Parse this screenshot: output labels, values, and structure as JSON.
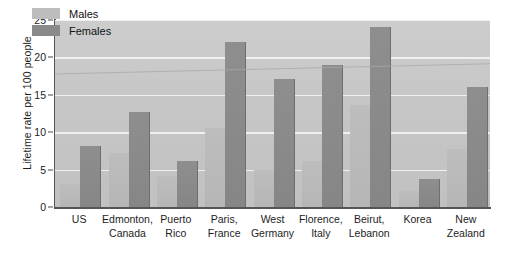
{
  "chart_data": {
    "type": "bar",
    "title": "",
    "xlabel": "",
    "ylabel": "Lifetime rate per 100 people",
    "ylim": [
      0,
      25
    ],
    "yticks": [
      0,
      5,
      10,
      15,
      20,
      25
    ],
    "grid": true,
    "legend_position": "top-left",
    "categories": [
      "US",
      "Edmonton, Canada",
      "Puerto Rico",
      "Paris, France",
      "West Germany",
      "Florence, Italy",
      "Beirut, Lebanon",
      "Korea",
      "New Zealand"
    ],
    "category_lines": [
      [
        "US"
      ],
      [
        "Edmonton,",
        "Canada"
      ],
      [
        "Puerto",
        "Rico"
      ],
      [
        "Paris,",
        "France"
      ],
      [
        "West",
        "Germany"
      ],
      [
        "Florence,",
        "Italy"
      ],
      [
        "Beirut,",
        "Lebanon"
      ],
      [
        "Korea"
      ],
      [
        "New",
        "Zealand"
      ]
    ],
    "series": [
      {
        "name": "Males",
        "color": "#bdbdbd",
        "values": [
          3.1,
          7.2,
          4.1,
          10.5,
          4.9,
          6.1,
          13.7,
          2.2,
          7.8
        ]
      },
      {
        "name": "Females",
        "color": "#8a8a8a",
        "values": [
          8.2,
          12.7,
          6.2,
          22.0,
          17.1,
          19.0,
          24.0,
          3.8,
          16.1
        ]
      }
    ]
  },
  "legend": {
    "items": [
      {
        "label": "Males"
      },
      {
        "label": "Females"
      }
    ]
  },
  "colors": {
    "plot_background": "#c6c6c6",
    "gridline": "#f2f2f2",
    "axis": "#555555",
    "male_bar": "#bdbdbd",
    "female_bar": "#8a8a8a",
    "text": "#1d1d1d"
  }
}
